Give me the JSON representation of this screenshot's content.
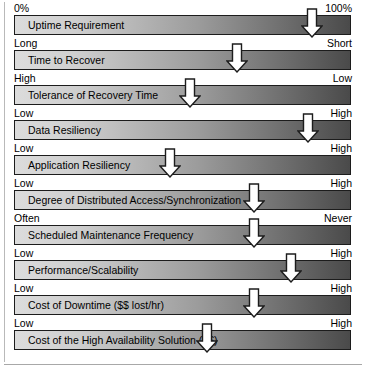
{
  "figure": {
    "bar_gradient": {
      "from": "#dcdcdc",
      "to": "#4a4a4a"
    },
    "marker_fill": "#ffffff",
    "marker_stroke": "#1c1c1c",
    "bar_border": "#1c1c1c"
  },
  "rows": [
    {
      "label": "Uptime Requirement",
      "left_cap": "0%",
      "right_cap": "100%",
      "marker_percent": 88
    },
    {
      "label": "Time to Recover",
      "left_cap": "Long",
      "right_cap": "Short",
      "marker_percent": 66
    },
    {
      "label": "Tolerance of Recovery Time",
      "left_cap": "High",
      "right_cap": "Low",
      "marker_percent": 52
    },
    {
      "label": "Data Resiliency",
      "left_cap": "Low",
      "right_cap": "High",
      "marker_percent": 87
    },
    {
      "label": "Application Resiliency",
      "left_cap": "Low",
      "right_cap": "High",
      "marker_percent": 46
    },
    {
      "label": "Degree of Distributed Access/Synchronization",
      "left_cap": "Low",
      "right_cap": "High",
      "marker_percent": 71
    },
    {
      "label": "Scheduled Maintenance Frequency",
      "left_cap": "Often",
      "right_cap": "Never",
      "marker_percent": 71
    },
    {
      "label": "Performance/Scalability",
      "left_cap": "Low",
      "right_cap": "High",
      "marker_percent": 82
    },
    {
      "label": "Cost of Downtime ($$ lost/hr)",
      "left_cap": "Low",
      "right_cap": "High",
      "marker_percent": 71
    },
    {
      "label": "Cost of the High Availability Solution ($$)",
      "left_cap": "Low",
      "right_cap": "High",
      "marker_percent": 57
    }
  ],
  "chart_data": {
    "type": "bar",
    "xlabel": "",
    "ylabel": "",
    "categories": [
      "Uptime Requirement",
      "Time to Recover",
      "Tolerance of Recovery Time",
      "Data Resiliency",
      "Application Resiliency",
      "Degree of Distributed Access/Synchronization",
      "Scheduled Maintenance Frequency",
      "Performance/Scalability",
      "Cost of Downtime ($$ lost/hr)",
      "Cost of the High Availability Solution ($$)"
    ],
    "values": [
      88,
      66,
      52,
      87,
      46,
      71,
      71,
      82,
      71,
      57
    ],
    "axis_min_labels": [
      "0%",
      "Long",
      "High",
      "Low",
      "Low",
      "Low",
      "Often",
      "Low",
      "Low",
      "Low"
    ],
    "axis_max_labels": [
      "100%",
      "Short",
      "Low",
      "High",
      "High",
      "High",
      "Never",
      "High",
      "High",
      "High"
    ],
    "xlim": [
      0,
      100
    ],
    "grid": false,
    "legend": "none"
  }
}
